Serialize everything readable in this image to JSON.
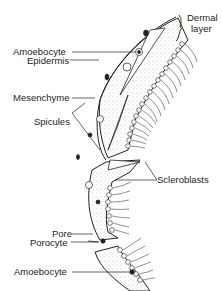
{
  "diagram": {
    "labels": [
      {
        "id": "dermal-layer",
        "text": "Dermal\nlayer",
        "line1": "Dermal",
        "line2": "layer"
      },
      {
        "id": "amoebocyte-top",
        "text": "Amoebocyte"
      },
      {
        "id": "epidermis",
        "text": "Epidermis"
      },
      {
        "id": "mesenchyme",
        "text": "Mesenchyme"
      },
      {
        "id": "spicules",
        "text": "Spicules"
      },
      {
        "id": "scleroblasts",
        "text": "Scleroblasts"
      },
      {
        "id": "pore",
        "text": "Pore"
      },
      {
        "id": "porocyte",
        "text": "Porocyte"
      },
      {
        "id": "amoebocyte-bottom",
        "text": "Amoebocyte"
      }
    ],
    "colors": {
      "line": "#222222",
      "stipple": "#888888",
      "background": "#ffffff"
    }
  }
}
